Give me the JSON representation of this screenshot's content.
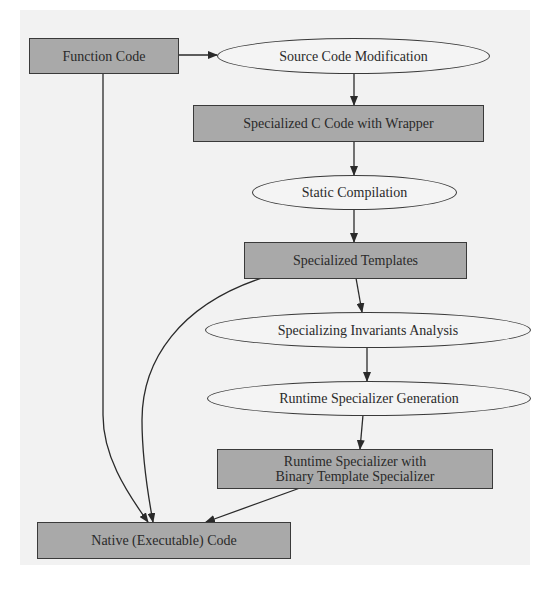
{
  "diagram": {
    "type": "flowchart",
    "colors": {
      "box_fill": "#a9a9a9",
      "ellipse_fill": "#f4f4f4",
      "stroke": "#3a3a3a",
      "background": "#f2f2f2"
    },
    "nodes": [
      {
        "id": "function_code",
        "shape": "box",
        "label": "Function Code"
      },
      {
        "id": "source_code_modification",
        "shape": "ellipse",
        "label": "Source Code Modification"
      },
      {
        "id": "specialized_c_code",
        "shape": "box",
        "label": "Specialized C Code with Wrapper"
      },
      {
        "id": "static_compilation",
        "shape": "ellipse",
        "label": "Static Compilation"
      },
      {
        "id": "specialized_templates",
        "shape": "box",
        "label": "Specialized Templates"
      },
      {
        "id": "specializing_invariants_analysis",
        "shape": "ellipse",
        "label": "Specializing Invariants Analysis"
      },
      {
        "id": "runtime_specializer_generation",
        "shape": "ellipse",
        "label": "Runtime Specializer Generation"
      },
      {
        "id": "runtime_specializer_binary",
        "shape": "box",
        "label_line1": "Runtime Specializer with",
        "label_line2": "Binary Template Specializer"
      },
      {
        "id": "native_code",
        "shape": "box",
        "label": "Native (Executable) Code"
      }
    ],
    "edges": [
      {
        "from": "function_code",
        "to": "source_code_modification"
      },
      {
        "from": "source_code_modification",
        "to": "specialized_c_code"
      },
      {
        "from": "specialized_c_code",
        "to": "static_compilation"
      },
      {
        "from": "static_compilation",
        "to": "specialized_templates"
      },
      {
        "from": "specialized_templates",
        "to": "specializing_invariants_analysis"
      },
      {
        "from": "specializing_invariants_analysis",
        "to": "runtime_specializer_generation"
      },
      {
        "from": "runtime_specializer_generation",
        "to": "runtime_specializer_binary"
      },
      {
        "from": "function_code",
        "to": "native_code"
      },
      {
        "from": "specialized_templates",
        "to": "native_code"
      },
      {
        "from": "runtime_specializer_binary",
        "to": "native_code"
      }
    ]
  }
}
